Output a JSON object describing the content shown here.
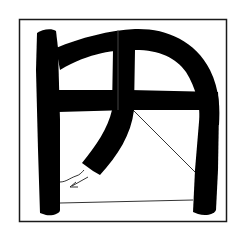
{
  "figure": {
    "character": "円",
    "colors": {
      "background": "#ffffff",
      "ink": "#000000",
      "frame": "#1a1a1a"
    }
  }
}
